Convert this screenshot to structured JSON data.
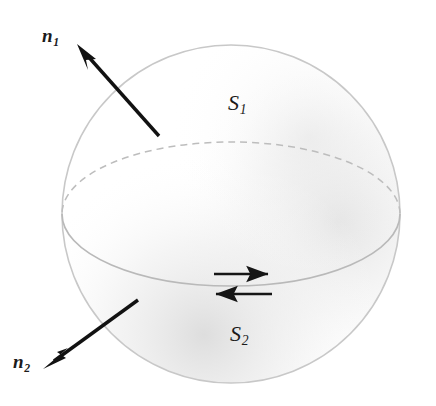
{
  "figure": {
    "background_color": "#ffffff",
    "width": 436,
    "height": 406
  },
  "sphere": {
    "name": "sphere",
    "center_x": 231,
    "center_y": 214,
    "radius": 169,
    "outline_color": "#c8c8c8",
    "outline_width": 1.6,
    "shading_color": "#ebebeb",
    "fill_color": "#ffffff"
  },
  "equator": {
    "name": "equator-ellipse",
    "center_x": 231,
    "center_y": 214,
    "rx": 169,
    "ry": 72,
    "front_color": "#b9b9b9",
    "back_color": "#bdbdbd",
    "back_style": "dashed",
    "front_style": "solid",
    "dash_pattern": "7 5"
  },
  "vectors": [
    {
      "id": "n1",
      "label": "n",
      "subscript": "1",
      "description": "outward normal of upper surface S1",
      "tail_x": 159,
      "tail_y": 136,
      "tip_x": 77,
      "tip_y": 44,
      "color": "#121212",
      "line_width": 3.4,
      "head_length": 19,
      "head_width": 11
    },
    {
      "id": "n2",
      "label": "n",
      "subscript": "2",
      "description": "outward normal of lower surface S2",
      "tail_x": 138,
      "tail_y": 300,
      "tip_x": 43,
      "tip_y": 369,
      "color": "#121212",
      "line_width": 3.4,
      "head_length": 19,
      "head_width": 11
    }
  ],
  "surfaces": [
    {
      "id": "S1",
      "label": "S",
      "subscript": "1",
      "description": "upper hemisphere surface"
    },
    {
      "id": "S2",
      "label": "S",
      "subscript": "2",
      "description": "lower hemisphere surface"
    }
  ],
  "boundary_arrows": [
    {
      "id": "arrow-right",
      "direction": "right",
      "description": "boundary circulation direction for upper surface",
      "start_x": 214,
      "start_y": 274,
      "end_x": 274,
      "end_y": 274,
      "color": "#161616",
      "line_width": 2.6
    },
    {
      "id": "arrow-left",
      "direction": "left",
      "description": "boundary circulation direction for lower surface",
      "start_x": 272,
      "start_y": 294,
      "end_x": 210,
      "end_y": 294,
      "color": "#161616",
      "line_width": 2.6
    }
  ]
}
